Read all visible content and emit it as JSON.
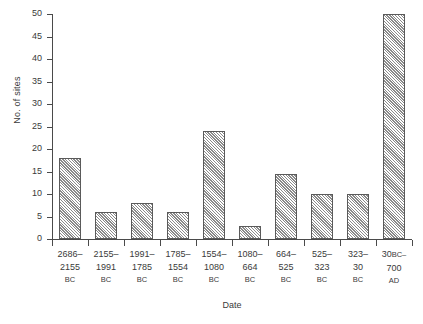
{
  "chart_data": {
    "type": "bar",
    "title": "",
    "xlabel": "Date",
    "ylabel": "No. of sites",
    "ylim": [
      0,
      50
    ],
    "ytick_step": 5,
    "grid": false,
    "legend": null,
    "categories": [
      "2686–2155 BC",
      "2155–1991 BC",
      "1991–1785 BC",
      "1785–1554 BC",
      "1554–1080 BC",
      "1080–664 BC",
      "664–525 BC",
      "525–323 BC",
      "323–30 BC",
      "30BC–700 AD"
    ],
    "values": [
      18,
      6,
      8,
      6,
      24,
      3,
      14.5,
      10,
      10,
      50
    ],
    "category_labels": [
      {
        "line1": "2686–",
        "line2": "2155",
        "era": "BC",
        "era_inline": ""
      },
      {
        "line1": "2155–",
        "line2": "1991",
        "era": "BC",
        "era_inline": ""
      },
      {
        "line1": "1991–",
        "line2": "1785",
        "era": "BC",
        "era_inline": ""
      },
      {
        "line1": "1785–",
        "line2": "1554",
        "era": "BC",
        "era_inline": ""
      },
      {
        "line1": "1554–",
        "line2": "1080",
        "era": "BC",
        "era_inline": ""
      },
      {
        "line1": "1080–",
        "line2": "664",
        "era": "BC",
        "era_inline": ""
      },
      {
        "line1": "664–",
        "line2": "525",
        "era": "BC",
        "era_inline": ""
      },
      {
        "line1": "525–",
        "line2": "323",
        "era": "BC",
        "era_inline": ""
      },
      {
        "line1": "323–",
        "line2": "30",
        "era": "BC",
        "era_inline": ""
      },
      {
        "line1": "30",
        "line2": "700",
        "era": "AD",
        "era_inline": "BC–"
      }
    ],
    "ytick_labels": [
      "0",
      "5",
      "10",
      "15",
      "20",
      "25",
      "30",
      "35",
      "40",
      "45",
      "50"
    ],
    "colors": {
      "axis": "#4a4a4a",
      "bar_fill": "#d2d2d2",
      "bar_edge": "#5a5a5a",
      "hatch": "#8a8a8a",
      "text": "#3a3a3a"
    }
  }
}
